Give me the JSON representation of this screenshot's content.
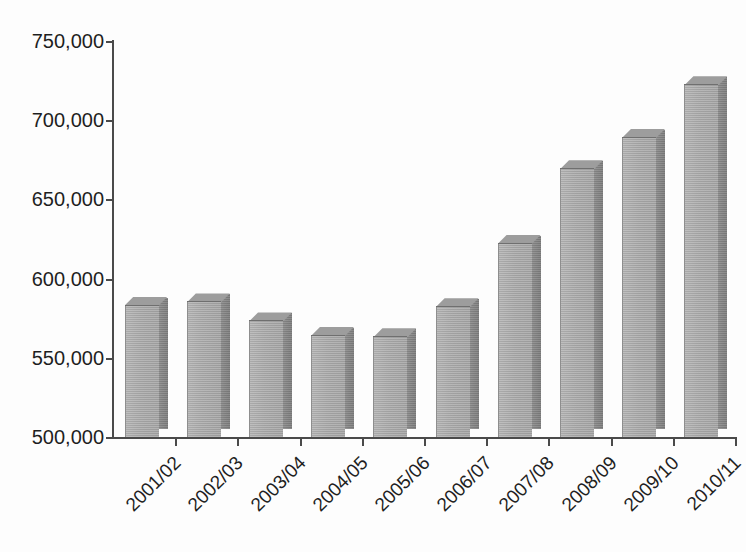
{
  "chart_data": {
    "type": "bar",
    "title": "",
    "subtitle": "",
    "xlabel": "",
    "ylabel": "",
    "categories": [
      "2001/02",
      "2002/03",
      "2003/04",
      "2004/05",
      "2005/06",
      "2006/07",
      "2007/08",
      "2008/09",
      "2009/10",
      "2010/11"
    ],
    "values": [
      583000,
      585000,
      573000,
      564000,
      563000,
      582000,
      622000,
      669000,
      689000,
      722000
    ],
    "ylim": [
      500000,
      750000
    ],
    "ytick_values": [
      500000,
      550000,
      600000,
      650000,
      700000,
      750000
    ],
    "ytick_labels": [
      "500,000",
      "550,000",
      "600,000",
      "650,000",
      "700,000",
      "750,000"
    ],
    "grid": false,
    "legend": null,
    "legend_position": "none",
    "annotations": [],
    "style": {
      "bar_face_color": "#a9a9a9",
      "bar_side_color": "#7f7f7f",
      "bar_top_color": "#9d9d9d",
      "axis_color": "#4a4a4a",
      "background_color": "#fdfdfd",
      "text_color": "#1f1f1f",
      "effect": "3d-bars",
      "xlabel_rotation_deg": -45
    }
  }
}
